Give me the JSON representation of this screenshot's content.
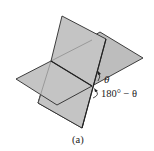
{
  "figure": {
    "caption": "(a)",
    "angle_label": "θ",
    "supplementary_label": "180° − θ",
    "colors": {
      "plane_fill": "#c4c4c4",
      "edge": "#2a2a2a",
      "background": "#ffffff"
    }
  }
}
